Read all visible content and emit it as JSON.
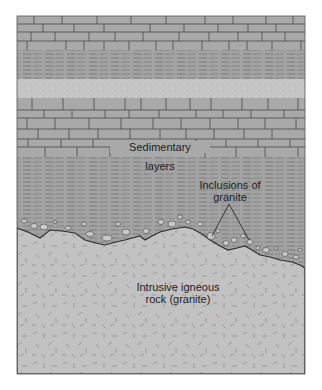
{
  "diagram": {
    "colors": {
      "limestone": "#a9a9a9",
      "shale": "#a3a3a3",
      "shale_dash": "#6e6e6e",
      "sandstone": "#c6c6c6",
      "granite": "#c2c2c2",
      "granite_mark": "#8a8a8a",
      "line": "#3a3a3a",
      "text": "#1e1e1e"
    },
    "layers": [
      {
        "name": "limestone",
        "top": 16,
        "bottom": 50
      },
      {
        "name": "shale",
        "top": 50,
        "bottom": 79
      },
      {
        "name": "sandstone",
        "top": 79,
        "bottom": 98
      },
      {
        "name": "limestone",
        "top": 98,
        "bottom": 157
      },
      {
        "name": "shale",
        "top": 157,
        "bottom": 270
      },
      {
        "name": "granite",
        "top": 228,
        "bottom": 374
      }
    ],
    "labels": {
      "sedimentary_line1": "Sedimentary",
      "sedimentary_line2": "layers",
      "inclusions_line1": "Inclusions of",
      "inclusions_line2": "granite",
      "granite_line1": "Intrusive igneous",
      "granite_line2": "rock (granite)"
    }
  }
}
